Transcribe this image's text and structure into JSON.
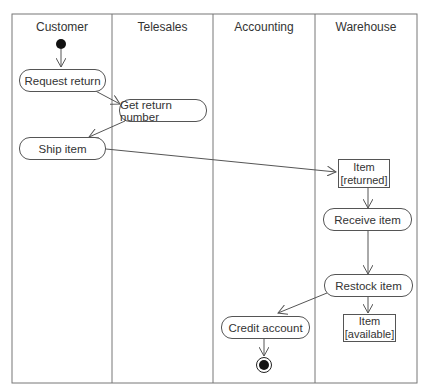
{
  "diagram": {
    "type": "uml-activity-swimlane",
    "lanes": [
      {
        "label": "Customer"
      },
      {
        "label": "Telesales"
      },
      {
        "label": "Accounting"
      },
      {
        "label": "Warehouse"
      }
    ],
    "nodes": {
      "request_return": "Request return",
      "get_return_number": "Get return number",
      "ship_item": "Ship item",
      "item_returned_name": "Item",
      "item_returned_state": "[returned]",
      "receive_item": "Receive item",
      "restock_item": "Restock item",
      "item_available_name": "Item",
      "item_available_state": "[available]",
      "credit_account": "Credit account"
    },
    "edges": [
      {
        "from": "start",
        "to": "Request return"
      },
      {
        "from": "Request return",
        "to": "Get return number"
      },
      {
        "from": "Get return number",
        "to": "Ship item"
      },
      {
        "from": "Ship item",
        "to": "Item [returned]"
      },
      {
        "from": "Item [returned]",
        "to": "Receive item"
      },
      {
        "from": "Receive item",
        "to": "Restock item"
      },
      {
        "from": "Restock item",
        "to": "Item [available]"
      },
      {
        "from": "Restock item",
        "to": "Credit account"
      },
      {
        "from": "Credit account",
        "to": "end"
      }
    ]
  }
}
